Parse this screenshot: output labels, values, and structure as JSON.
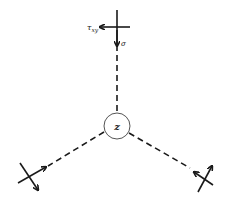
{
  "diagram": {
    "center_label": "z",
    "top_labels": {
      "shear": "τ",
      "shear_sub": "xy",
      "normal": "σ"
    },
    "colors": {
      "stroke": "#1a1a1a",
      "background": "#ffffff"
    }
  }
}
